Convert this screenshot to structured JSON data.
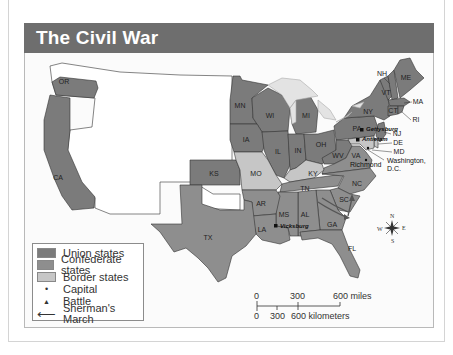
{
  "title": "The Civil War",
  "colors": {
    "title_bar": "#6e6e6e",
    "union": "#7b7b7b",
    "confederate": "#8e8e8e",
    "border_states": "#c6c6c6",
    "territory": "#ffffff",
    "water": "#e3e3e3",
    "outline": "#333333"
  },
  "legend": {
    "items": [
      {
        "label": "Union states",
        "type": "swatch",
        "color": "#7b7b7b"
      },
      {
        "label": "Confederate states",
        "type": "swatch",
        "color": "#8e8e8e"
      },
      {
        "label": "Border states",
        "type": "swatch",
        "color": "#c6c6c6"
      },
      {
        "label": "Capital",
        "type": "symbol",
        "symbol": "•"
      },
      {
        "label": "Battle",
        "type": "symbol",
        "symbol": "▲"
      },
      {
        "label": "Sherman's March",
        "type": "symbol",
        "symbol": "⟵"
      }
    ]
  },
  "scale": {
    "miles": [
      "0",
      "300",
      "600 miles"
    ],
    "kilometers": [
      "0",
      "300",
      "600 kilometers"
    ]
  },
  "compass": {
    "n": "N",
    "s": "S",
    "e": "E",
    "w": "W"
  },
  "states": {
    "union": [
      "OR",
      "CA",
      "MN",
      "WI",
      "IA",
      "MI",
      "IL",
      "IN",
      "OH",
      "PA",
      "NY",
      "NH",
      "VT",
      "ME",
      "MA",
      "RI",
      "CT",
      "NJ",
      "KS",
      "WV"
    ],
    "confederate": [
      "TX",
      "AR",
      "LA",
      "MS",
      "AL",
      "TN",
      "GA",
      "FL",
      "SC",
      "NC",
      "VA"
    ],
    "border": [
      "MO",
      "KY",
      "MD",
      "DE"
    ]
  },
  "labels": {
    "OR": "OR",
    "CA": "CA",
    "MN": "MN",
    "WI": "WI",
    "IA": "IA",
    "MI": "MI",
    "IL": "IL",
    "IN": "IN",
    "OH": "OH",
    "PA": "PA",
    "NY": "NY",
    "NH": "NH",
    "VT": "VT",
    "ME": "ME",
    "MA": "MA",
    "RI": "RI",
    "CT": "CT",
    "NJ": "NJ",
    "DE": "DE",
    "MD": "MD",
    "KS": "KS",
    "MO": "MO",
    "KY": "KY",
    "WV": "WV",
    "VA": "VA",
    "TN": "TN",
    "NC": "NC",
    "SC": "SC",
    "GA": "GA",
    "AL": "AL",
    "MS": "MS",
    "AR": "AR",
    "LA": "LA",
    "TX": "TX",
    "FL": "FL"
  },
  "places": {
    "gettysburg": "Gettysburg",
    "antietam": "Antietam",
    "richmond": "Richmond",
    "washington_line1": "Washington,",
    "washington_line2": "D.C.",
    "vicksburg": "Vicksburg"
  }
}
